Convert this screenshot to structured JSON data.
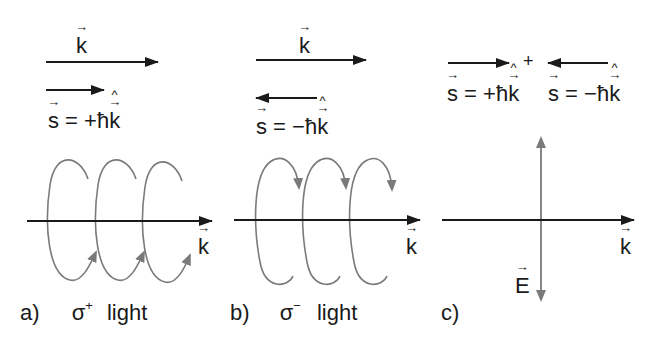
{
  "panels": {
    "a": {
      "k_label": "k",
      "s_eq_prefix": "s",
      "s_eq_mid": " = +ħ",
      "s_eq_k": "k",
      "caption_letter": "a)",
      "caption_sigma": "σ",
      "caption_sup": "+",
      "caption_light": "light",
      "axis_k_label": "k"
    },
    "b": {
      "k_label": "k",
      "s_eq_prefix": "s",
      "s_eq_mid": " = −ħ",
      "s_eq_k": "k",
      "caption_letter": "b)",
      "caption_sigma": "σ",
      "caption_sup": "−",
      "caption_light": "light",
      "axis_k_label": "k"
    },
    "c": {
      "plus": "+",
      "s1_prefix": "s",
      "s1_mid": " = +ħ",
      "s1_k": "k",
      "s2_prefix": "s",
      "s2_mid": " = −ħ",
      "s2_k": "k",
      "axis_k_label": "k",
      "e_label": "E",
      "caption_letter": "c)"
    }
  },
  "colors": {
    "black_arrow": "#1a1a1a",
    "gray_curve": "#7a7a7a"
  }
}
